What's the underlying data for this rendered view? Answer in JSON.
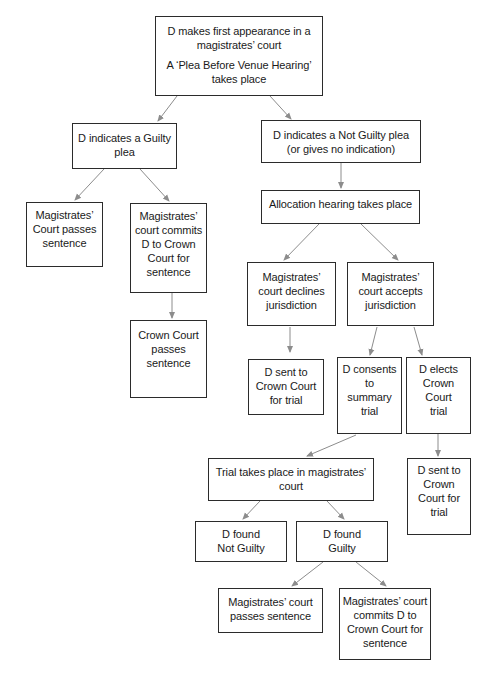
{
  "diagram": {
    "type": "flowchart",
    "colors": {
      "border": "#2b2b2b",
      "arrow": "#8c8c8c",
      "text": "#1a1a1a",
      "background": "#ffffff"
    },
    "nodes": {
      "first_appearance": {
        "lines": [
          "D makes first appearance in a",
          "magistrates’ court"
        ],
        "lines2": [
          "A ‘Plea Before Venue Hearing’",
          "takes place"
        ]
      },
      "guilty_plea": {
        "lines": [
          "D indicates a Guilty",
          "plea"
        ]
      },
      "not_guilty_plea": {
        "lines": [
          "D indicates a Not Guilty plea",
          "(or gives no indication)"
        ]
      },
      "mc_passes_sentence_left": {
        "lines": [
          "Magistrates’",
          "Court passes",
          "sentence"
        ]
      },
      "mc_commits_left": {
        "lines": [
          "Magistrates’",
          "court commits",
          "D to Crown",
          "Court for",
          "sentence"
        ]
      },
      "crown_passes_sentence": {
        "lines": [
          "Crown Court",
          "passes",
          "sentence"
        ]
      },
      "allocation_hearing": {
        "lines": [
          "Allocation hearing takes place"
        ]
      },
      "mc_declines": {
        "lines": [
          "Magistrates’",
          "court declines",
          "jurisdiction"
        ]
      },
      "mc_accepts": {
        "lines": [
          "Magistrates’",
          "court accepts",
          "jurisdiction"
        ]
      },
      "sent_crown_trial_1": {
        "lines": [
          "D sent to",
          "Crown Court",
          "for trial"
        ]
      },
      "consents_summary": {
        "lines": [
          "D consents",
          "to",
          "summary",
          "trial"
        ]
      },
      "elects_crown": {
        "lines": [
          "D elects",
          "Crown",
          "Court",
          "trial"
        ]
      },
      "sent_crown_trial_2": {
        "lines": [
          "D sent to",
          "Crown",
          "Court for",
          "trial"
        ]
      },
      "trial_magistrates": {
        "lines": [
          "Trial takes place in magistrates’",
          "court"
        ]
      },
      "found_not_guilty": {
        "lines": [
          "D found",
          "Not Guilty"
        ]
      },
      "found_guilty": {
        "lines": [
          "D found",
          "Guilty"
        ]
      },
      "mc_passes_sentence_bottom": {
        "lines": [
          "Magistrates’ court",
          "passes sentence"
        ]
      },
      "mc_commits_bottom": {
        "lines": [
          "Magistrates’ court",
          "commits D to",
          "Crown Court for",
          "sentence"
        ]
      }
    },
    "edges": [
      {
        "from": "first_appearance",
        "to": "guilty_plea"
      },
      {
        "from": "first_appearance",
        "to": "not_guilty_plea"
      },
      {
        "from": "guilty_plea",
        "to": "mc_passes_sentence_left"
      },
      {
        "from": "guilty_plea",
        "to": "mc_commits_left"
      },
      {
        "from": "mc_commits_left",
        "to": "crown_passes_sentence"
      },
      {
        "from": "not_guilty_plea",
        "to": "allocation_hearing"
      },
      {
        "from": "allocation_hearing",
        "to": "mc_declines"
      },
      {
        "from": "allocation_hearing",
        "to": "mc_accepts"
      },
      {
        "from": "mc_declines",
        "to": "sent_crown_trial_1"
      },
      {
        "from": "mc_accepts",
        "to": "consents_summary"
      },
      {
        "from": "mc_accepts",
        "to": "elects_crown"
      },
      {
        "from": "elects_crown",
        "to": "sent_crown_trial_2"
      },
      {
        "from": "consents_summary",
        "to": "trial_magistrates"
      },
      {
        "from": "trial_magistrates",
        "to": "found_not_guilty"
      },
      {
        "from": "trial_magistrates",
        "to": "found_guilty"
      },
      {
        "from": "found_guilty",
        "to": "mc_passes_sentence_bottom"
      },
      {
        "from": "found_guilty",
        "to": "mc_commits_bottom"
      }
    ]
  }
}
